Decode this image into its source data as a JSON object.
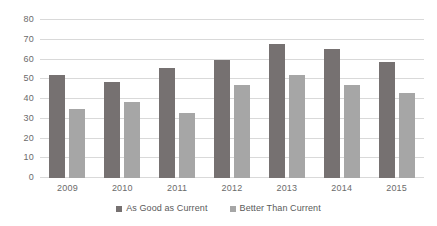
{
  "chart_data": {
    "type": "bar",
    "title": "",
    "subtitle": "",
    "xlabel": "",
    "ylabel": "",
    "categories": [
      "2009",
      "2010",
      "2011",
      "2012",
      "2013",
      "2014",
      "2015"
    ],
    "series": [
      {
        "name": "As Good as Current",
        "color": "#767171",
        "values": [
          52,
          48.5,
          55.5,
          60,
          68,
          65.5,
          58.5
        ]
      },
      {
        "name": "Better Than Current",
        "color": "#a6a6a6",
        "values": [
          35,
          38.5,
          33,
          47,
          52,
          47,
          43
        ]
      }
    ],
    "ylim": [
      0,
      80
    ],
    "yticks": [
      0,
      10,
      20,
      30,
      40,
      50,
      60,
      70,
      80
    ],
    "ytick_labels": [
      "0",
      "10",
      "20",
      "30",
      "40",
      "50",
      "60",
      "70",
      "80"
    ],
    "grid": true,
    "grid_axis": "y",
    "grid_color": "#d9d9d9",
    "legend_position": "bottom",
    "background": "#ffffff",
    "annotations": []
  },
  "legend": {
    "items": [
      {
        "label": "As Good as Current",
        "color": "#767171"
      },
      {
        "label": "Better Than Current",
        "color": "#a6a6a6"
      }
    ]
  }
}
